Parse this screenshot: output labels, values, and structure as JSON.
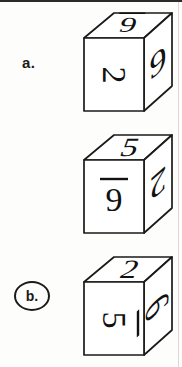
{
  "page": {
    "background_color": "#fdfdfc",
    "ink_color": "#1a1a1a",
    "top_rule_color": "#2b2b2b",
    "right_rule_color": "#d9d9d9"
  },
  "options": [
    {
      "id": "a",
      "label": "a.",
      "selected": false,
      "cube": {
        "name": "cube-a",
        "faces": {
          "top": {
            "digit": "6",
            "underlined": true,
            "rotation_deg": 180
          },
          "front": {
            "digit": "2",
            "underlined": false,
            "rotation_deg": 90
          },
          "right": {
            "digit": "9",
            "underlined": false,
            "rotation_deg": 0
          }
        }
      }
    },
    {
      "id": "b",
      "label": "b.",
      "selected": true,
      "cube": {
        "name": "cube-b",
        "faces": {
          "top": {
            "digit": "5",
            "underlined": false,
            "rotation_deg": 0
          },
          "front": {
            "digit": "9",
            "underlined": true,
            "rotation_deg": 0
          },
          "right": {
            "digit": "2",
            "underlined": false,
            "rotation_deg": 180
          }
        }
      }
    },
    {
      "id": "c",
      "label": "c.",
      "selected": false,
      "cube": {
        "name": "cube-c",
        "faces": {
          "top": {
            "digit": "2",
            "underlined": false,
            "rotation_deg": 0
          },
          "front": {
            "digit": "5",
            "underlined": false,
            "rotation_deg": 90
          },
          "right": {
            "digit": "6",
            "underlined": true,
            "rotation_deg": 90
          }
        }
      }
    }
  ]
}
